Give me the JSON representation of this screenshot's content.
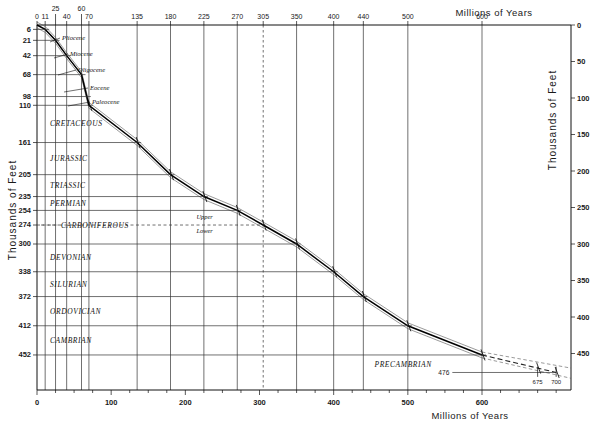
{
  "chart_data": {
    "type": "line",
    "xlabel": "Millions  of  Years",
    "ylabel": "Thousands  of  Feet",
    "xlabel_top": "Millions  of  Years",
    "ylabel_right": "Thousands  of  Feet",
    "xlim": [
      0,
      720
    ],
    "ylim": [
      0,
      500
    ],
    "y_inverted": true,
    "grid": true,
    "legend": "none",
    "x_top_ticks": [
      0,
      11,
      25,
      40,
      60,
      70,
      135,
      180,
      225,
      270,
      305,
      350,
      400,
      440,
      500,
      600
    ],
    "x_top_tick_labels": [
      "0",
      "11",
      "25",
      "40",
      "60",
      "70",
      "135",
      "180",
      "225",
      "270",
      "305",
      "350",
      "400",
      "440",
      "500",
      "600"
    ],
    "x_top_dashed_gridline": 305,
    "x_bottom_ticks": [
      0,
      100,
      200,
      300,
      400,
      500,
      600
    ],
    "x_bottom_tick_labels": [
      "0",
      "100",
      "200",
      "300",
      "400",
      "500",
      "600"
    ],
    "x_bottom_minor_step": 25,
    "y_left_ticks": [
      6,
      21,
      42,
      68,
      98,
      110,
      161,
      205,
      235,
      254,
      274,
      300,
      338,
      372,
      412,
      452
    ],
    "y_left_tick_labels": [
      "6",
      "21",
      "42",
      "68",
      "98",
      "110",
      "161",
      "205",
      "235",
      "254",
      "274",
      "300",
      "338",
      "372",
      "412",
      "452"
    ],
    "y_right_ticks": [
      0,
      50,
      100,
      150,
      200,
      250,
      300,
      350,
      400,
      450
    ],
    "y_right_tick_labels": [
      "0",
      "50",
      "100",
      "150",
      "200",
      "250",
      "300",
      "350",
      "400",
      "450"
    ],
    "epochs": [
      {
        "name": "Pliocene",
        "age_ma": 11,
        "thickness_kft": 6
      },
      {
        "name": "Miocene",
        "age_ma": 25,
        "thickness_kft": 21
      },
      {
        "name": "Oligocene",
        "age_ma": 40,
        "thickness_kft": 42
      },
      {
        "name": "Eocene",
        "age_ma": 60,
        "thickness_kft": 68
      },
      {
        "name": "Paleocene",
        "age_ma": 70,
        "thickness_kft": 110
      }
    ],
    "periods": [
      {
        "name": "CRETACEOUS",
        "base_age_ma": 135,
        "base_thickness_kft": 161
      },
      {
        "name": "JURASSIC",
        "base_age_ma": 180,
        "base_thickness_kft": 205
      },
      {
        "name": "TRIASSIC",
        "base_age_ma": 225,
        "base_thickness_kft": 235
      },
      {
        "name": "PERMIAN",
        "base_age_ma": 270,
        "base_thickness_kft": 254
      },
      {
        "name": "CARBONIFEROUS",
        "base_age_ma": 350,
        "base_thickness_kft": 300
      },
      {
        "name": "DEVONIAN",
        "base_age_ma": 400,
        "base_thickness_kft": 338
      },
      {
        "name": "SILURIAN",
        "base_age_ma": 440,
        "base_thickness_kft": 372
      },
      {
        "name": "ORDOVICIAN",
        "base_age_ma": 500,
        "base_thickness_kft": 412
      },
      {
        "name": "CAMBRIAN",
        "base_age_ma": 600,
        "base_thickness_kft": 452
      },
      {
        "name": "PRECAMBRIAN",
        "base_age_ma": 700,
        "base_thickness_kft": 476
      }
    ],
    "carboniferous_subdivisions": {
      "upper": "Upper",
      "lower": "Lower",
      "boundary_thickness_kft": 274,
      "boundary_age_ma": 305
    },
    "series": [
      {
        "name": "thickness curve (central)",
        "style": "solid",
        "points": [
          [
            0,
            0
          ],
          [
            11,
            6
          ],
          [
            25,
            21
          ],
          [
            40,
            42
          ],
          [
            60,
            68
          ],
          [
            70,
            110
          ],
          [
            135,
            161
          ],
          [
            180,
            205
          ],
          [
            225,
            235
          ],
          [
            270,
            254
          ],
          [
            305,
            274
          ],
          [
            350,
            300
          ],
          [
            400,
            338
          ],
          [
            440,
            372
          ],
          [
            500,
            412
          ],
          [
            600,
            452
          ]
        ]
      },
      {
        "name": "thickness curve (upper bound)",
        "style": "thin",
        "offset_kft": -4
      },
      {
        "name": "thickness curve (lower bound)",
        "style": "thin",
        "offset_kft": 4
      },
      {
        "name": "precambrian extrapolation (central)",
        "style": "dashed",
        "points": [
          [
            600,
            452
          ],
          [
            700,
            476
          ]
        ]
      },
      {
        "name": "precambrian extrapolation (upper)",
        "style": "dashed-thin",
        "points": [
          [
            600,
            448
          ],
          [
            720,
            470
          ]
        ]
      },
      {
        "name": "precambrian extrapolation (lower)",
        "style": "dashed-thin",
        "points": [
          [
            600,
            456
          ],
          [
            720,
            484
          ]
        ]
      }
    ],
    "annotations": [
      {
        "text": "476",
        "x_ma": 560,
        "y_kft": 476,
        "role": "precambrian-thickness"
      },
      {
        "text": "675",
        "x_ma": 675,
        "role": "precambrian-age-tick"
      },
      {
        "text": "700",
        "x_ma": 700,
        "role": "precambrian-age-tick"
      }
    ],
    "error_bar_ages_ma": [
      70,
      135,
      180,
      225,
      270,
      305,
      350,
      400,
      440,
      500,
      600,
      675,
      700
    ]
  },
  "labels": {
    "top_axis_title": "Millions  of  Years",
    "bottom_axis_title": "Millions  of  Years",
    "left_axis_title": "Thousands  of  Feet",
    "right_axis_title": "Thousands  of  Feet",
    "precambrian": "PRECAMBRIAN",
    "carb_upper": "Upper",
    "carb_lower": "Lower",
    "ann_476": "476",
    "ann_675": "675",
    "ann_700": "700"
  }
}
